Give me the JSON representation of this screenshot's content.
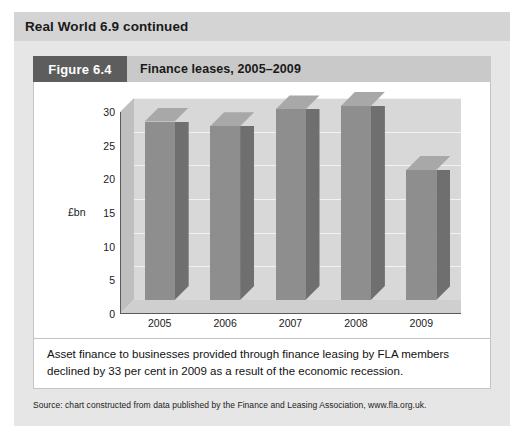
{
  "header": {
    "title": "Real World 6.9 continued"
  },
  "figure": {
    "tag": "Figure 6.4",
    "title": "Finance leases, 2005–2009"
  },
  "caption": {
    "text": "Asset finance to businesses provided through finance leasing by FLA members declined by 33 per cent in 2009 as a result of the economic recession."
  },
  "source": {
    "text": "Source: chart constructed from data published by the Finance and Leasing Association, www.fla.org.uk."
  },
  "chart_data": {
    "type": "bar",
    "title": "Finance leases, 2005–2009",
    "categories": [
      "2005",
      "2006",
      "2007",
      "2008",
      "2009"
    ],
    "values": [
      26.5,
      25.8,
      28.3,
      28.8,
      19.3
    ],
    "xlabel": "",
    "ylabel": "£bn",
    "ylim": [
      0,
      30
    ],
    "yticks": [
      0,
      5,
      10,
      15,
      20,
      25,
      30
    ],
    "grid": true,
    "legend": false,
    "style": "3d-column",
    "colors": {
      "bar_front": "#8e8e8e",
      "bar_side": "#6f6f6f",
      "bar_top": "#a8a8a8",
      "back_wall": "#d8d8d8",
      "side_wall": "#bfbfbf",
      "floor": "#cfcfcf",
      "gridline": "#f2f2f2",
      "axis": "#5a5a5a"
    }
  },
  "theme": {
    "panel_bg": "#e6e6e6",
    "header_bg": "#d4d4d4",
    "figbar_bg": "#c9c9c9",
    "figtag_bg": "#5d5d5d",
    "card_bg": "#ffffff",
    "text": "#1a1a1a"
  }
}
